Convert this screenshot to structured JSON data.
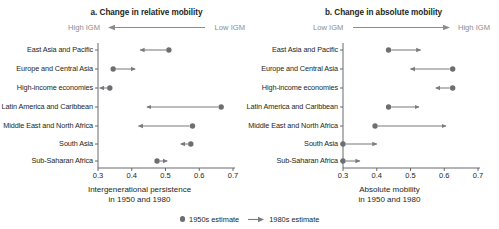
{
  "figure": {
    "legend": {
      "series_1950s_label": "1950s estimate",
      "series_1980s_label": "1980s estimate",
      "dot_icon": "filled-circle-icon",
      "arrow_icon": "right-arrow-icon"
    },
    "colors": {
      "marker": "#6d6e71",
      "arrow": "#7a7b7e",
      "axis": "#58595b",
      "text": "#231f20",
      "muted_text": "#8c8c8c"
    }
  },
  "chart_data": [
    {
      "type": "scatter",
      "panel_id": "a",
      "title": "a. Change in relative mobility",
      "direction_left_label": "High IGM",
      "direction_right_label": "Low IGM",
      "direction_arrow": "left",
      "xlabel": "Intergenerational persistence",
      "xlabel_line2": "in 1950 and 1980",
      "ylabel": "",
      "xlim": [
        0.3,
        0.7
      ],
      "xticks": [
        0.3,
        0.4,
        0.5,
        0.6,
        0.7
      ],
      "xticklabels": [
        "0.3",
        "0.4",
        "0.5",
        "0.6",
        "0.7"
      ],
      "grid": false,
      "categories": [
        "East Asia and Pacific",
        "Europe and Central Asia",
        "High-income economies",
        "Latin America and Caribbean",
        "Middle East and North Africa",
        "South Asia",
        "Sub-Saharan Africa"
      ],
      "series": [
        {
          "name": "1950s estimate",
          "values": [
            0.51,
            0.345,
            0.335,
            0.665,
            0.58,
            0.575,
            0.475
          ]
        },
        {
          "name": "1980s estimate",
          "values": [
            0.425,
            0.41,
            0.305,
            0.445,
            0.42,
            0.545,
            0.505
          ]
        }
      ]
    },
    {
      "type": "scatter",
      "panel_id": "b",
      "title": "b. Change in absolute mobility",
      "direction_left_label": "Low IGM",
      "direction_right_label": "High IGM",
      "direction_arrow": "right",
      "xlabel": "Absolute mobility",
      "xlabel_line2": "in 1950 and 1980",
      "ylabel": "",
      "xlim": [
        0.3,
        0.7
      ],
      "xticks": [
        0.3,
        0.4,
        0.5,
        0.6,
        0.7
      ],
      "xticklabels": [
        "0.3",
        "0.4",
        "0.5",
        "0.6",
        "0.7"
      ],
      "grid": false,
      "categories": [
        "East Asia and Pacific",
        "Europe and Central Asia",
        "High-income economies",
        "Latin America and Caribbean",
        "Middle East and North Africa",
        "South Asia",
        "Sub-Saharan Africa"
      ],
      "series": [
        {
          "name": "1950s estimate",
          "values": [
            0.435,
            0.625,
            0.625,
            0.435,
            0.395,
            0.3,
            0.3
          ]
        },
        {
          "name": "1980s estimate",
          "values": [
            0.53,
            0.5,
            0.575,
            0.525,
            0.605,
            0.4,
            0.35
          ]
        }
      ]
    }
  ]
}
